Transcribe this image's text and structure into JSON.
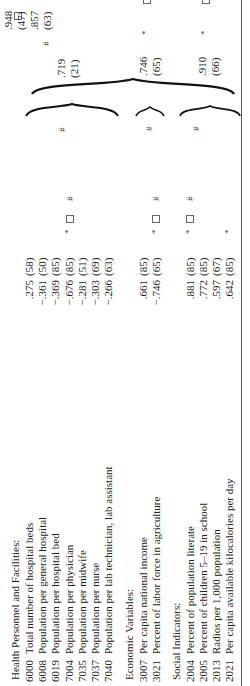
{
  "table": {
    "sections": [
      {
        "title": "Health Personnel and Facilities:",
        "rows": [
          {
            "code": "6000",
            "label": "Total number of hospital beds",
            "r": ".275",
            "n": "(58)",
            "star": false
          },
          {
            "code": "6008",
            "label": "Population per general hospital",
            "r": "−.361",
            "n": "(50)",
            "star": false
          },
          {
            "code": "6019",
            "label": "Population per hospital bed",
            "r": "−.369",
            "n": "(85)",
            "star": false
          },
          {
            "code": "7004",
            "label": "Population per physician",
            "r": "−.676",
            "n": "(85)",
            "star": true
          },
          {
            "code": "7035",
            "label": "Population per midwife",
            "r": "−.281",
            "n": "(51)",
            "star": false
          },
          {
            "code": "7037",
            "label": "Population per nurse",
            "r": "−.303",
            "n": "(69)",
            "star": false
          },
          {
            "code": "7040",
            "label": "Population per lab technician, lab assistant",
            "r": "−.266",
            "n": "(63)",
            "star": false
          }
        ],
        "group_marks": {
          "box": "□",
          "hash": "#"
        },
        "group_result": {
          "r": ".719",
          "n": "(21)"
        }
      },
      {
        "title": "Economic Variables:",
        "rows": [
          {
            "code": "3007",
            "label": "Per capita national income",
            "r": ".661",
            "n": "(85)",
            "star": false
          },
          {
            "code": "3021",
            "label": "Percent of labor force in agriculture",
            "r": "−.746",
            "n": "(65)",
            "star": true
          }
        ],
        "group_marks": {
          "box": "□",
          "hash": "#"
        },
        "group_result": {
          "r": ".746",
          "n": "(65)",
          "star": true,
          "box": "□",
          "hash": "#"
        }
      },
      {
        "title": "Social Indicators:",
        "rows": [
          {
            "code": "2004",
            "label": "Percent of population literate",
            "r": ".881",
            "n": "(85)",
            "star": true
          },
          {
            "code": "2005",
            "label": "Percent of children 5–19 in school",
            "r": ".772",
            "n": "(85)",
            "star": false
          },
          {
            "code": "2013",
            "label": "Radios per 1,000 population",
            "r": ".597",
            "n": "(67)",
            "star": false
          },
          {
            "code": "2021",
            "label": "Per capita available kilocalories per day",
            "r": ".642",
            "n": "(85)",
            "star": true
          }
        ],
        "group_marks": {
          "box": "□",
          "hash": "#"
        },
        "group_result": {
          "r": ".910",
          "n": "(66)",
          "star": true,
          "box": "□",
          "hash": "#"
        }
      }
    ],
    "final_result": {
      "r1": ".948",
      "n1": "(47)",
      "r2": ".857",
      "n2": "(63)",
      "box": "□",
      "hash": "#"
    },
    "symbols": {
      "star": "*",
      "box": "□",
      "hash": "#"
    }
  }
}
